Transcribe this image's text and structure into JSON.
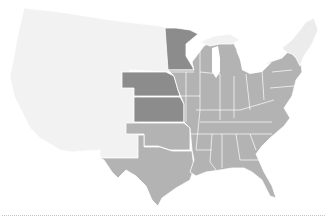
{
  "map": {
    "type": "choropleth",
    "region": "Contiguous United States",
    "colors": {
      "light": "#f2f2f2",
      "medium": "#b3b3b3",
      "dark": "#8c8c8c",
      "border": "#ffffff",
      "divider": "#c4c4c4"
    },
    "groups": {
      "light": [
        "Washington",
        "Oregon",
        "California",
        "Idaho",
        "Nevada",
        "Montana",
        "Wyoming",
        "Utah",
        "Arizona",
        "Colorado",
        "New Mexico",
        "North Dakota",
        "South Dakota",
        "Maine",
        "New Hampshire",
        "Vermont",
        "Massachusetts",
        "Michigan Upper Peninsula"
      ],
      "dark": [
        "Minnesota",
        "Nebraska",
        "Kansas"
      ],
      "medium": [
        "Oklahoma",
        "Texas",
        "Iowa",
        "Missouri",
        "Arkansas",
        "Louisiana",
        "Wisconsin",
        "Illinois",
        "Michigan",
        "Indiana",
        "Ohio",
        "Kentucky",
        "Tennessee",
        "Mississippi",
        "Alabama",
        "Georgia",
        "Florida",
        "South Carolina",
        "North Carolina",
        "Virginia",
        "West Virginia",
        "Pennsylvania",
        "New York",
        "New Jersey",
        "Maryland",
        "Delaware",
        "Connecticut"
      ]
    }
  }
}
